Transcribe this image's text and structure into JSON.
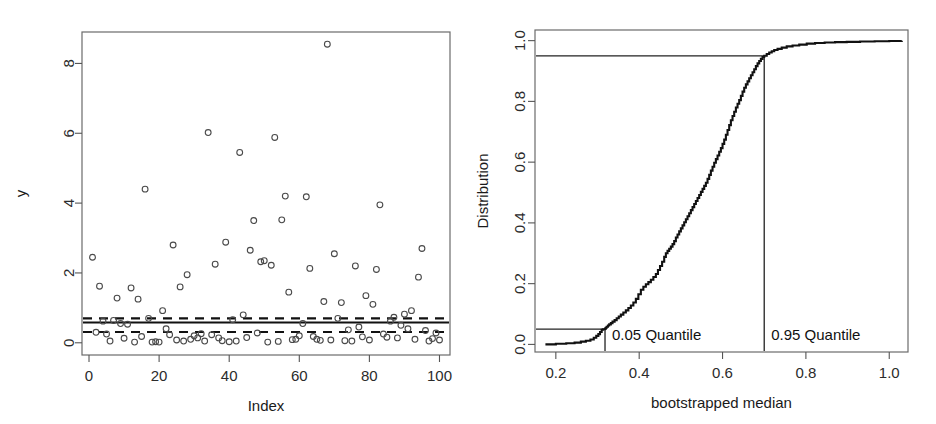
{
  "figure": {
    "width": 936,
    "height": 424,
    "background": "#ffffff",
    "ink_color": "#111111"
  },
  "chart_data": [
    {
      "id": "scatter-index-y",
      "type": "scatter",
      "title": "",
      "xlabel": "Index",
      "ylabel": "y",
      "xlim": [
        -2,
        103
      ],
      "ylim": [
        -0.35,
        8.9
      ],
      "xticks": [
        0,
        20,
        40,
        60,
        80,
        100
      ],
      "yticks": [
        0,
        2,
        4,
        6,
        8
      ],
      "grid": false,
      "legend": "none",
      "marker": "open-circle",
      "x": [
        1,
        2,
        3,
        4,
        5,
        6,
        7,
        8,
        9,
        10,
        11,
        12,
        13,
        14,
        15,
        16,
        17,
        18,
        19,
        20,
        21,
        22,
        23,
        24,
        25,
        26,
        27,
        28,
        29,
        30,
        31,
        32,
        33,
        34,
        35,
        36,
        37,
        38,
        39,
        40,
        41,
        42,
        43,
        44,
        45,
        46,
        47,
        48,
        49,
        50,
        51,
        52,
        53,
        54,
        55,
        56,
        57,
        58,
        59,
        60,
        61,
        62,
        63,
        64,
        65,
        66,
        67,
        68,
        69,
        70,
        71,
        72,
        73,
        74,
        75,
        76,
        77,
        78,
        79,
        80,
        81,
        82,
        83,
        84,
        85,
        86,
        87,
        88,
        89,
        90,
        91,
        92,
        93,
        94,
        95,
        96,
        97,
        98,
        99,
        100
      ],
      "y": [
        2.45,
        0.3,
        1.62,
        0.62,
        0.25,
        0.05,
        0.64,
        1.28,
        0.55,
        0.13,
        0.53,
        1.57,
        0.02,
        1.25,
        0.18,
        4.4,
        0.7,
        0.02,
        0.03,
        0.02,
        0.92,
        0.4,
        0.23,
        2.8,
        0.08,
        1.6,
        0.05,
        1.95,
        0.1,
        0.2,
        0.14,
        0.26,
        0.05,
        6.02,
        0.23,
        2.25,
        0.14,
        0.06,
        2.88,
        0.03,
        0.66,
        0.05,
        5.45,
        0.8,
        0.15,
        2.65,
        3.5,
        0.28,
        2.32,
        2.35,
        0.02,
        2.22,
        5.88,
        0.04,
        3.52,
        4.2,
        1.45,
        0.09,
        0.1,
        0.2,
        0.55,
        4.18,
        2.13,
        0.18,
        0.1,
        0.07,
        1.18,
        8.55,
        0.08,
        2.55,
        0.7,
        1.15,
        0.06,
        0.37,
        0.05,
        2.2,
        0.45,
        0.17,
        1.35,
        0.08,
        1.1,
        2.1,
        3.95,
        0.25,
        0.16,
        0.62,
        0.73,
        0.14,
        0.5,
        0.82,
        0.4,
        0.92,
        0.1,
        1.88,
        2.7,
        0.35,
        0.05,
        0.12,
        0.28,
        0.08
      ],
      "reference_lines": [
        {
          "name": "median-estimate",
          "style": "solid",
          "y": 0.58
        },
        {
          "name": "upper-confidence-bound",
          "style": "dashed",
          "y": 0.7
        },
        {
          "name": "lower-confidence-bound",
          "style": "dashed",
          "y": 0.31
        }
      ]
    },
    {
      "id": "bootstrap-ecdf",
      "type": "line",
      "title": "",
      "xlabel": "bootstrapped median",
      "ylabel": "Distribution",
      "xlim": [
        0.15,
        1.045
      ],
      "ylim": [
        -0.025,
        1.035
      ],
      "xticks": [
        0.2,
        0.4,
        0.6,
        0.8,
        1.0
      ],
      "xticklabels": [
        "0.2",
        "0.4",
        "0.6",
        "0.8",
        "1.0"
      ],
      "yticks": [
        0.0,
        0.2,
        0.4,
        0.6,
        0.8,
        1.0
      ],
      "yticklabels": [
        "0.0",
        "0.2",
        "0.4",
        "0.6",
        "0.8",
        "1.0"
      ],
      "grid": false,
      "legend": "none",
      "series": [
        {
          "name": "empirical cdf of bootstrapped median",
          "x": [
            0.175,
            0.2,
            0.225,
            0.245,
            0.26,
            0.272,
            0.283,
            0.291,
            0.297,
            0.302,
            0.306,
            0.31,
            0.313,
            0.316,
            0.318,
            0.32,
            0.322,
            0.325,
            0.328,
            0.332,
            0.336,
            0.341,
            0.346,
            0.351,
            0.356,
            0.362,
            0.368,
            0.374,
            0.38,
            0.386,
            0.392,
            0.398,
            0.404,
            0.41,
            0.416,
            0.422,
            0.428,
            0.434,
            0.44,
            0.445,
            0.45,
            0.455,
            0.46,
            0.464,
            0.468,
            0.472,
            0.476,
            0.48,
            0.484,
            0.488,
            0.492,
            0.496,
            0.5,
            0.504,
            0.508,
            0.512,
            0.516,
            0.52,
            0.524,
            0.528,
            0.532,
            0.536,
            0.54,
            0.544,
            0.548,
            0.552,
            0.556,
            0.56,
            0.564,
            0.568,
            0.572,
            0.576,
            0.58,
            0.584,
            0.588,
            0.592,
            0.596,
            0.6,
            0.604,
            0.608,
            0.612,
            0.616,
            0.62,
            0.624,
            0.628,
            0.632,
            0.636,
            0.64,
            0.644,
            0.648,
            0.652,
            0.656,
            0.66,
            0.664,
            0.668,
            0.672,
            0.676,
            0.68,
            0.684,
            0.688,
            0.692,
            0.696,
            0.7,
            0.706,
            0.712,
            0.718,
            0.724,
            0.732,
            0.742,
            0.754,
            0.768,
            0.784,
            0.802,
            0.822,
            0.845,
            0.87,
            0.898,
            0.93,
            0.965,
            1.0,
            1.03
          ],
          "y": [
            0.0,
            0.002,
            0.004,
            0.006,
            0.009,
            0.012,
            0.016,
            0.022,
            0.028,
            0.034,
            0.041,
            0.048,
            0.05,
            0.05,
            0.052,
            0.055,
            0.058,
            0.062,
            0.066,
            0.07,
            0.075,
            0.08,
            0.086,
            0.092,
            0.098,
            0.105,
            0.112,
            0.12,
            0.128,
            0.138,
            0.15,
            0.165,
            0.18,
            0.19,
            0.198,
            0.205,
            0.213,
            0.222,
            0.232,
            0.245,
            0.258,
            0.272,
            0.288,
            0.3,
            0.308,
            0.315,
            0.322,
            0.33,
            0.34,
            0.352,
            0.362,
            0.372,
            0.382,
            0.392,
            0.402,
            0.412,
            0.422,
            0.432,
            0.442,
            0.452,
            0.462,
            0.472,
            0.482,
            0.492,
            0.502,
            0.512,
            0.522,
            0.532,
            0.545,
            0.558,
            0.572,
            0.585,
            0.598,
            0.61,
            0.622,
            0.634,
            0.646,
            0.66,
            0.674,
            0.69,
            0.706,
            0.722,
            0.738,
            0.752,
            0.766,
            0.78,
            0.792,
            0.804,
            0.818,
            0.832,
            0.845,
            0.856,
            0.866,
            0.876,
            0.886,
            0.896,
            0.906,
            0.916,
            0.925,
            0.933,
            0.94,
            0.946,
            0.95,
            0.956,
            0.961,
            0.965,
            0.969,
            0.973,
            0.977,
            0.981,
            0.984,
            0.987,
            0.99,
            0.992,
            0.994,
            0.995,
            0.996,
            0.997,
            0.998,
            0.999,
            1.0
          ]
        }
      ],
      "annotations": [
        {
          "name": "lower-quantile",
          "label": "0.05 Quantile",
          "x": 0.318,
          "level": 0.05,
          "marker_lines": [
            "vertical",
            "horizontal"
          ]
        },
        {
          "name": "upper-quantile",
          "label": "0.95 Quantile",
          "x": 0.7,
          "level": 0.95,
          "marker_lines": [
            "vertical",
            "horizontal"
          ]
        }
      ]
    }
  ]
}
